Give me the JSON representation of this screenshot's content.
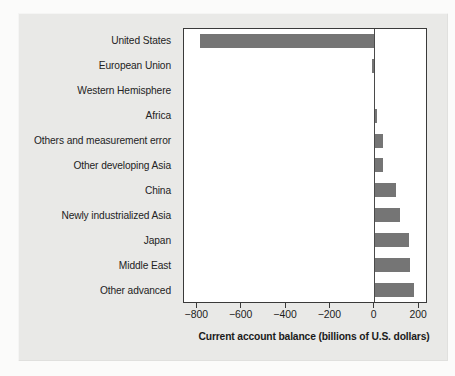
{
  "figure": {
    "panel_background": "#e9e9e7",
    "plot_background": "#ffffff",
    "bar_color": "#757575",
    "axis_color": "#3a3a3a"
  },
  "chart_data": {
    "type": "bar",
    "orientation": "horizontal",
    "title": "",
    "subtitle": "",
    "xlabel": "Current account balance (billions of U.S. dollars)",
    "ylabel": "",
    "xlim": [
      -860,
      240
    ],
    "xticks": [
      -800,
      -600,
      -400,
      -200,
      0,
      200
    ],
    "xtick_labels": [
      "−800",
      "−600",
      "−400",
      "−200",
      "0",
      "200"
    ],
    "grid": false,
    "legend": null,
    "units": "billions of U.S. dollars",
    "categories": [
      "United States",
      "European Union",
      "Western Hemisphere",
      "Africa",
      "Others and measurement error",
      "Other developing Asia",
      "China",
      "Newly industrialized Asia",
      "Japan",
      "Middle East",
      "Other advanced"
    ],
    "values": [
      -790,
      -12,
      -5,
      10,
      35,
      38,
      95,
      115,
      155,
      158,
      175
    ],
    "series": [
      {
        "name": "Current account balance",
        "values": [
          -790,
          -12,
          -5,
          10,
          35,
          38,
          95,
          115,
          155,
          158,
          175
        ]
      }
    ]
  }
}
